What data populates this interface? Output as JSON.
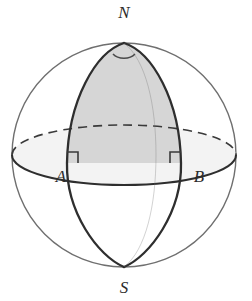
{
  "figure": {
    "background_color": "#ffffff",
    "outline_color": "#6f6f6f",
    "meridian_color": "#2e2e2e",
    "lune_fill_color": "#d6d6d6",
    "equator_disc_fill": "#dcdcdc",
    "label_color": "#2b2b2b"
  },
  "labels": {
    "north_pole": "N",
    "south_pole": "S",
    "point_a": "A",
    "point_b": "B"
  },
  "geometry": {
    "sphere_center_x": 124,
    "sphere_center_y": 155,
    "sphere_radius": 112,
    "equator_semi_minor": 30,
    "north_pole_x": 124,
    "north_pole_y": 43,
    "south_pole_x": 124,
    "south_pole_y": 267,
    "point_a_x": 67,
    "point_a_y": 163,
    "point_b_x": 181,
    "point_b_y": 163,
    "lune_half_width": 57,
    "right_angle_marker_size": 11
  },
  "annotations": {
    "right_angle_at_a": "right angle",
    "right_angle_at_b": "right angle",
    "apex_angle_at_n": "dihedral angle arc"
  }
}
